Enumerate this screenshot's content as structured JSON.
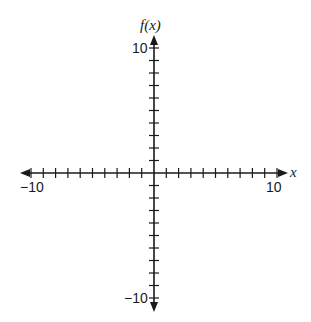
{
  "graph": {
    "x_axis_label": "x",
    "y_axis_label": "f(x)",
    "x_min_label": "−10",
    "x_max_label": "10",
    "y_max_label": "10",
    "y_min_label": "−10",
    "x_range": [
      -10,
      10
    ],
    "y_range": [
      -10,
      10
    ],
    "tick_interval": 1,
    "colors": {
      "axis": "#1a1a1a",
      "background": "#ffffff"
    }
  }
}
